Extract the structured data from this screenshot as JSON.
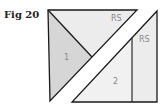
{
  "figure": {
    "label": "Fig 20",
    "pieces": [
      {
        "id": "1",
        "label": "1",
        "fill": "#d6d6d6"
      },
      {
        "id": "rs-top",
        "label": "RS",
        "fill": "#ececec"
      },
      {
        "id": "2",
        "label": "2",
        "fill": "#f1f1f1"
      },
      {
        "id": "rs-right",
        "label": "RS",
        "fill": "#ececec"
      }
    ],
    "colors": {
      "stroke": "#1a1a1a",
      "background": "#ffffff"
    }
  }
}
